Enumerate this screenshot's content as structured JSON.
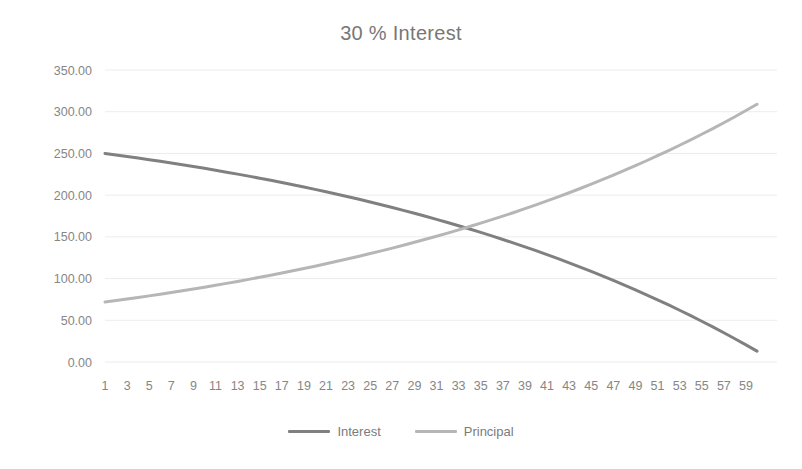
{
  "chart_data": {
    "type": "line",
    "title": "30 % Interest",
    "xlabel": "",
    "ylabel": "",
    "ylim": [
      0,
      350
    ],
    "yticks": [
      0,
      50,
      100,
      150,
      200,
      250,
      300,
      350
    ],
    "ytick_labels": [
      "0.00",
      "50.00",
      "100.00",
      "150.00",
      "200.00",
      "250.00",
      "300.00",
      "350.00"
    ],
    "xlim": [
      1,
      60
    ],
    "xticks": [
      1,
      3,
      5,
      7,
      9,
      11,
      13,
      15,
      17,
      19,
      21,
      23,
      25,
      27,
      29,
      31,
      33,
      35,
      37,
      39,
      41,
      43,
      45,
      47,
      49,
      51,
      53,
      55,
      57,
      59
    ],
    "xtick_labels": [
      "1",
      "3",
      "5",
      "7",
      "9",
      "11",
      "13",
      "15",
      "17",
      "19",
      "21",
      "23",
      "25",
      "27",
      "29",
      "31",
      "33",
      "35",
      "37",
      "39",
      "41",
      "43",
      "45",
      "47",
      "49",
      "51",
      "53",
      "55",
      "57",
      "59"
    ],
    "grid": true,
    "grid_axis": "y",
    "legend_position": "bottom",
    "x": [
      1,
      2,
      3,
      4,
      5,
      6,
      7,
      8,
      9,
      10,
      11,
      12,
      13,
      14,
      15,
      16,
      17,
      18,
      19,
      20,
      21,
      22,
      23,
      24,
      25,
      26,
      27,
      28,
      29,
      30,
      31,
      32,
      33,
      34,
      35,
      36,
      37,
      38,
      39,
      40,
      41,
      42,
      43,
      44,
      45,
      46,
      47,
      48,
      49,
      50,
      51,
      52,
      53,
      54,
      55,
      56,
      57,
      58,
      59,
      60
    ],
    "series": [
      {
        "name": "Interest",
        "color": "#808080",
        "values": [
          250.0,
          248.21,
          246.37,
          244.48,
          242.55,
          240.56,
          238.53,
          236.44,
          234.3,
          232.11,
          229.86,
          227.56,
          225.19,
          222.77,
          220.29,
          217.75,
          215.14,
          212.47,
          209.73,
          206.92,
          204.05,
          201.1,
          198.08,
          194.98,
          191.8,
          188.55,
          185.21,
          181.79,
          178.28,
          174.69,
          171.0,
          167.23,
          163.35,
          159.39,
          155.32,
          151.15,
          146.88,
          142.5,
          138.01,
          133.41,
          128.7,
          123.86,
          118.91,
          113.83,
          108.63,
          103.29,
          97.83,
          92.22,
          86.48,
          80.59,
          74.56,
          68.37,
          62.03,
          55.53,
          48.87,
          42.04,
          35.04,
          27.87,
          20.52,
          12.98
        ],
        "start_value": 250.0,
        "end_value": 12.98
      },
      {
        "name": "Principal",
        "color": "#b6b6b6",
        "values": [
          71.8,
          73.6,
          75.44,
          77.32,
          79.26,
          81.24,
          83.28,
          85.36,
          87.5,
          89.69,
          91.94,
          94.24,
          96.6,
          99.02,
          101.5,
          104.04,
          106.65,
          109.31,
          112.05,
          114.85,
          117.73,
          120.67,
          123.69,
          126.79,
          129.96,
          133.21,
          136.54,
          139.96,
          143.46,
          147.05,
          150.73,
          154.51,
          158.38,
          162.35,
          166.42,
          170.59,
          174.87,
          179.25,
          183.75,
          188.35,
          193.07,
          197.91,
          202.87,
          207.95,
          213.16,
          218.5,
          223.97,
          229.58,
          235.33,
          241.22,
          247.27,
          253.46,
          259.8,
          266.31,
          272.98,
          279.82,
          286.83,
          294.01,
          301.38,
          308.93
        ],
        "start_value": 71.8,
        "end_value": 308.93
      }
    ]
  },
  "legend": {
    "items": [
      {
        "label": "Interest",
        "color": "#808080"
      },
      {
        "label": "Principal",
        "color": "#b6b6b6"
      }
    ]
  }
}
